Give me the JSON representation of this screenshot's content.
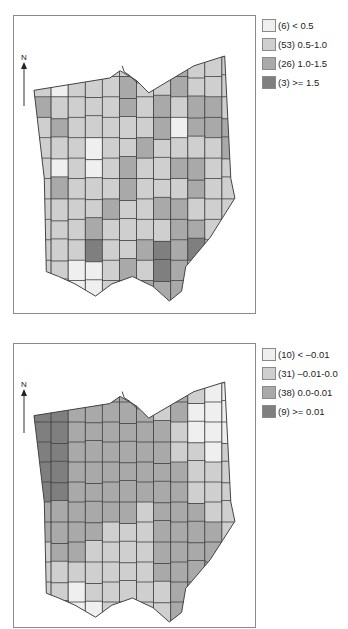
{
  "colors": {
    "c0": "#efefef",
    "c1": "#cfcfcf",
    "c2": "#a9a9a9",
    "c3": "#7f7f7f",
    "border": "#444444",
    "frame": "#8a8a8a"
  },
  "maps": [
    {
      "id": "map-top",
      "north_label": "N",
      "legend": [
        {
          "label": "(6) < 0.5",
          "color_key": "c0"
        },
        {
          "label": "(53) 0.5-1.0",
          "color_key": "c1"
        },
        {
          "label": "(26) 1.0-1.5",
          "color_key": "c2"
        },
        {
          "label": "(3) >= 1.5",
          "color_key": "c3"
        }
      ],
      "grid": [
        [
          1,
          1,
          2,
          1,
          1,
          1,
          1,
          1,
          2,
          1,
          1,
          1
        ],
        [
          1,
          0,
          1,
          1,
          1,
          2,
          1,
          1,
          2,
          1,
          1,
          1
        ],
        [
          2,
          1,
          1,
          1,
          1,
          2,
          1,
          2,
          1,
          2,
          2,
          1
        ],
        [
          1,
          2,
          1,
          1,
          1,
          1,
          1,
          2,
          0,
          2,
          2,
          2
        ],
        [
          1,
          1,
          1,
          0,
          1,
          1,
          2,
          1,
          1,
          1,
          1,
          2
        ],
        [
          1,
          0,
          1,
          0,
          1,
          2,
          1,
          1,
          2,
          2,
          1,
          1
        ],
        [
          1,
          2,
          1,
          1,
          1,
          2,
          1,
          1,
          1,
          2,
          1,
          1
        ],
        [
          1,
          1,
          1,
          1,
          2,
          1,
          1,
          2,
          2,
          1,
          1,
          1
        ],
        [
          1,
          1,
          1,
          2,
          1,
          1,
          1,
          1,
          2,
          2,
          1,
          1
        ],
        [
          1,
          1,
          1,
          3,
          1,
          1,
          2,
          3,
          2,
          3,
          1,
          1
        ],
        [
          1,
          1,
          0,
          0,
          1,
          2,
          1,
          3,
          2,
          1,
          1,
          1
        ],
        [
          0,
          0,
          0,
          0,
          1,
          2,
          2,
          2,
          2,
          1,
          1,
          1
        ]
      ]
    },
    {
      "id": "map-bottom",
      "north_label": "N",
      "legend": [
        {
          "label": "(10) < –0.01",
          "color_key": "c0"
        },
        {
          "label": "(31) –0.01-0.0",
          "color_key": "c1"
        },
        {
          "label": "(38) 0.0-0.01",
          "color_key": "c2"
        },
        {
          "label": "(9) >= 0.01",
          "color_key": "c3"
        }
      ],
      "grid": [
        [
          3,
          2,
          2,
          2,
          2,
          2,
          1,
          1,
          2,
          1,
          0,
          0
        ],
        [
          3,
          3,
          2,
          2,
          2,
          2,
          2,
          1,
          2,
          0,
          0,
          0
        ],
        [
          3,
          3,
          2,
          2,
          2,
          2,
          2,
          2,
          1,
          0,
          0,
          0
        ],
        [
          3,
          3,
          2,
          2,
          2,
          2,
          2,
          2,
          1,
          1,
          0,
          1
        ],
        [
          3,
          3,
          2,
          2,
          2,
          2,
          2,
          2,
          2,
          1,
          1,
          1
        ],
        [
          3,
          3,
          2,
          2,
          2,
          2,
          2,
          2,
          2,
          1,
          1,
          1
        ],
        [
          2,
          2,
          2,
          2,
          2,
          2,
          1,
          2,
          2,
          2,
          1,
          1
        ],
        [
          2,
          2,
          2,
          2,
          1,
          1,
          1,
          2,
          2,
          2,
          2,
          1
        ],
        [
          1,
          2,
          2,
          1,
          1,
          1,
          1,
          2,
          2,
          2,
          2,
          2
        ],
        [
          1,
          1,
          1,
          1,
          1,
          1,
          1,
          2,
          2,
          2,
          2,
          1
        ],
        [
          1,
          1,
          0,
          1,
          1,
          1,
          1,
          1,
          2,
          2,
          1,
          1
        ],
        [
          0,
          0,
          0,
          0,
          1,
          1,
          1,
          1,
          2,
          2,
          1,
          1
        ]
      ]
    }
  ]
}
